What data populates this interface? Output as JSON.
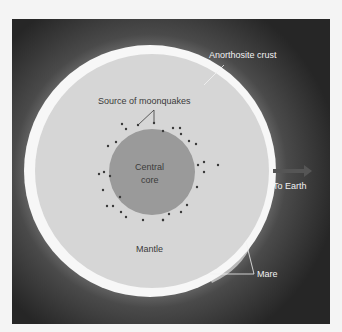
{
  "diagram": {
    "labels": {
      "crust": "Anorthosite crust",
      "moonquakes": "Source of moonquakes",
      "core_line1": "Central",
      "core_line2": "core",
      "mantle": "Mantle",
      "earth": "To Earth",
      "mare": "Mare"
    },
    "colors": {
      "background": "#2b2b2b",
      "crust": "#f7f7f7",
      "mantle": "#d6d6d6",
      "core": "#9a9a9a",
      "moonquake_dot": "#3a3a3a",
      "mare": "#b8b8b8"
    },
    "arrow_icon": "right-arrow-icon"
  }
}
